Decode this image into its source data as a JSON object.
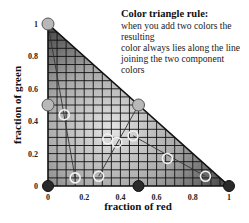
{
  "annotation": {
    "title": "Color triangle rule:",
    "lines": [
      "when you add two colors the resulting",
      "color always lies along the line",
      "joining the two component colors"
    ]
  },
  "chart_data": {
    "type": "scatter",
    "title": "Color triangle rule",
    "xlabel": "fraction of red",
    "ylabel": "fraction of green",
    "xlim": [
      0,
      1
    ],
    "ylim": [
      0,
      1
    ],
    "x_ticks": [
      "0",
      "0.2",
      "0.4",
      "0.6",
      "0.8",
      "1"
    ],
    "y_ticks": [
      "0",
      "0.2",
      "0.4",
      "0.6",
      "0.8",
      "1"
    ],
    "grid": true,
    "region": "triangle (0,0)-(1,0)-(0,1), gray gradient fill",
    "primary_points": [
      {
        "x": 0,
        "y": 1,
        "style": "gray"
      },
      {
        "x": 0,
        "y": 0.5,
        "style": "gray"
      },
      {
        "x": 0.5,
        "y": 0.5,
        "style": "gray"
      },
      {
        "x": 0,
        "y": 0,
        "style": "dark"
      },
      {
        "x": 0.5,
        "y": 0,
        "style": "dark"
      },
      {
        "x": 1,
        "y": 0,
        "style": "dark"
      }
    ],
    "mixture_points": [
      {
        "x": 0.09,
        "y": 0.44
      },
      {
        "x": 0.15,
        "y": 0.05
      },
      {
        "x": 0.28,
        "y": 0.06
      },
      {
        "x": 0.38,
        "y": 0.27
      },
      {
        "x": 0.33,
        "y": 0.29
      },
      {
        "x": 0.47,
        "y": 0.31
      },
      {
        "x": 0.66,
        "y": 0.17
      },
      {
        "x": 0.87,
        "y": 0.06
      }
    ],
    "mixing_lines": [
      {
        "from": [
          0,
          1
        ],
        "to": [
          0.15,
          0.05
        ]
      },
      {
        "from": [
          0.5,
          0.5
        ],
        "to": [
          0.28,
          0.06
        ]
      },
      {
        "from": [
          0.47,
          0.31
        ],
        "to": [
          0.87,
          0.06
        ]
      }
    ]
  }
}
